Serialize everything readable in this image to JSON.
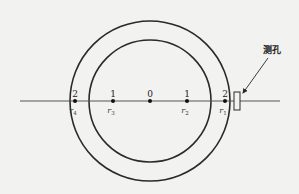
{
  "diagram": {
    "type": "cross-section measurement point layout",
    "colors": {
      "line": "#2a2a2a",
      "background": "#f2f2f0"
    },
    "circles": [
      {
        "name": "outer-circle",
        "cx": 150,
        "cy": 101,
        "r": 80
      },
      {
        "name": "inner-circle",
        "cx": 150,
        "cy": 101,
        "r": 61
      }
    ],
    "axis": {
      "x1": 20,
      "x2": 280,
      "y": 101
    },
    "points": [
      {
        "x": 75,
        "number": "2",
        "radius_label": "r",
        "radius_sub": "4"
      },
      {
        "x": 113,
        "number": "1",
        "radius_label": "r",
        "radius_sub": "3"
      },
      {
        "x": 150,
        "number": "0",
        "radius_label": "",
        "radius_sub": ""
      },
      {
        "x": 187,
        "number": "1",
        "radius_label": "r",
        "radius_sub": "2"
      },
      {
        "x": 225,
        "number": "2",
        "radius_label": "r",
        "radius_sub": "1"
      }
    ],
    "probe_hole": {
      "label": "测孔",
      "rect": {
        "x": 234,
        "y": 92,
        "w": 6,
        "h": 18
      },
      "arrow_from": {
        "x": 268,
        "y": 58
      },
      "arrow_to": {
        "x": 243,
        "y": 93
      }
    }
  }
}
